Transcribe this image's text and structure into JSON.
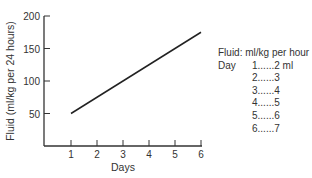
{
  "chart_data": {
    "type": "line",
    "title": "",
    "xlabel": "Days",
    "ylabel": "Fluid (ml/kg per 24 hours)",
    "x": [
      1,
      2,
      3,
      4,
      5,
      6
    ],
    "series": [
      {
        "name": "Fluid requirement",
        "values": [
          50,
          75,
          100,
          125,
          150,
          175
        ]
      }
    ],
    "xticks": [
      "1",
      "2",
      "3",
      "4",
      "5",
      "6"
    ],
    "yticks": [
      "50",
      "100",
      "150",
      "200"
    ],
    "ylim": [
      0,
      200
    ],
    "xlim": [
      0,
      6
    ],
    "grid": false,
    "legend_position": "right",
    "annotation": {
      "title": "Fluid: ml/kg per hour",
      "day_label": "Day",
      "rows": [
        {
          "day": "1",
          "value": "2 ml"
        },
        {
          "day": "2",
          "value": "3"
        },
        {
          "day": "3",
          "value": "4"
        },
        {
          "day": "4",
          "value": "5"
        },
        {
          "day": "5",
          "value": "6"
        },
        {
          "day": "6",
          "value": "7"
        }
      ]
    }
  },
  "labels": {
    "row1": "1......2 ml",
    "row2": "2......3",
    "row3": "3......4",
    "row4": "4......5",
    "row5": "5......6",
    "row6": "6......7"
  }
}
